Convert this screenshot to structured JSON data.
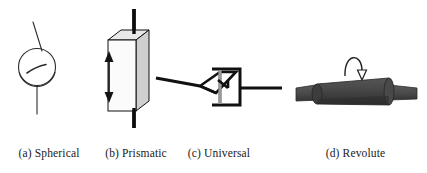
{
  "figure": {
    "name": "kinematic-joint-types",
    "background_color": "#ffffff",
    "panel_count": 4
  },
  "panels": [
    {
      "id": "spherical",
      "caption": "(a) Spherical",
      "icon_name": "spherical-joint-diagram",
      "description": "Ball joint drawn as an outlined circle with a small interior arc, a thin link line extending up-left above and a thin link line extending straight down below",
      "line_color": "#2b2b2b",
      "fill_color": "#ffffff",
      "stroke_width": 1
    },
    {
      "id": "prismatic",
      "caption": "(b) Prismatic",
      "icon_name": "prismatic-joint-diagram",
      "description": "Sliding block drawn as a 3D rectangular prism in oblique projection threaded on a thick vertical black rod, with a vertical double headed arrow at the left indicating translation",
      "line_color": "#000000",
      "front_face_color": "#fbfbfb",
      "side_face_color": "#cfcfcf",
      "top_face_color": "#e8e8e8",
      "rod_color": "#0d0d0d",
      "arrow_color": "#141414",
      "motion": "translation"
    },
    {
      "id": "universal",
      "caption": "(c) Universal",
      "icon_name": "universal-joint-diagram",
      "description": "Hooke joint drawn as a flat parallelogram yoke on the left joined to a C shaped bracket yoke on the right by a grey cross pin, with thick straight shafts leaving to the left and to the right",
      "line_color": "#111111",
      "pin_color": "#9a9a9a",
      "stroke_width": 3
    },
    {
      "id": "revolute",
      "caption": "(d) Revolute",
      "icon_name": "revolute-joint-diagram",
      "description": "Hinge joint drawn as a shaded dark grey cylinder barrel with narrower coaxial shafts protruding left and right, topped by a curved arrow looping over the barrel with an open arrowhead pointing down",
      "barrel_color": "#4a4a4a",
      "barrel_shadow_color": "#2e2e2e",
      "shaft_color": "#4f4f4f",
      "arrow_color": "#1f1f1f",
      "motion": "rotation"
    }
  ]
}
